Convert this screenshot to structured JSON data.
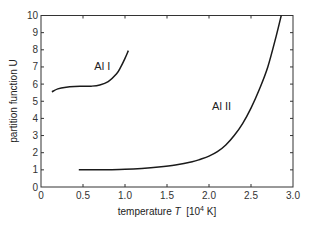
{
  "chart_data": {
    "type": "line",
    "title": "",
    "xlabel": "temperature T [10^4 K]",
    "xlabel_parts": {
      "prefix": "temperature ",
      "italic": "T",
      "unit_open": "  [10",
      "sup": "4",
      "unit_close": " K]"
    },
    "ylabel": "partition function U",
    "xlim": [
      0,
      3.0
    ],
    "ylim": [
      0,
      10
    ],
    "xticks": [
      "0",
      "0.5",
      "1.0",
      "1.5",
      "2.0",
      "2.5",
      "3.0"
    ],
    "xtick_values": [
      0,
      0.5,
      1.0,
      1.5,
      2.0,
      2.5,
      3.0
    ],
    "yticks": [
      "0",
      "1",
      "2",
      "3",
      "4",
      "5",
      "6",
      "7",
      "8",
      "9",
      "10"
    ],
    "ytick_values": [
      0,
      1,
      2,
      3,
      4,
      5,
      6,
      7,
      8,
      9,
      10
    ],
    "grid": false,
    "legend": "none (inline curve labels)",
    "series": [
      {
        "name": "Al I",
        "label_position": {
          "x": 0.73,
          "y": 6.85
        },
        "x": [
          0.13,
          0.2,
          0.3,
          0.4,
          0.5,
          0.6,
          0.7,
          0.8,
          0.9,
          0.95,
          1.0,
          1.04
        ],
        "y": [
          5.55,
          5.72,
          5.82,
          5.86,
          5.87,
          5.88,
          5.95,
          6.15,
          6.6,
          7.0,
          7.5,
          7.95
        ]
      },
      {
        "name": "Al II",
        "label_position": {
          "x": 2.15,
          "y": 4.5
        },
        "x": [
          0.45,
          0.6,
          0.8,
          1.0,
          1.2,
          1.4,
          1.6,
          1.8,
          1.9,
          2.0,
          2.1,
          2.2,
          2.3,
          2.4,
          2.5,
          2.6,
          2.7,
          2.8,
          2.86
        ],
        "y": [
          1.0,
          1.0,
          1.01,
          1.03,
          1.08,
          1.16,
          1.28,
          1.47,
          1.62,
          1.8,
          2.06,
          2.45,
          3.0,
          3.7,
          4.6,
          5.7,
          7.0,
          8.8,
          10.0
        ]
      }
    ]
  }
}
